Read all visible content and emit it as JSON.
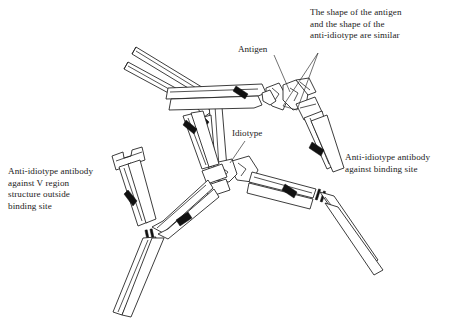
{
  "figure": {
    "type": "line-diagram",
    "background_color": "#ffffff",
    "ink_color": "#1a1a1a"
  },
  "captions": {
    "top_right": "The shape of the antigen\nand the shape of the\nanti-idiotype are similar",
    "left": "Anti-idiotype antibody\nagainst V region\nstructure outside\nbinding site",
    "right": "Anti-idiotype antibody\nagainst binding site"
  },
  "labels": {
    "antigen": "Antigen",
    "idiotype": "Idiotype"
  },
  "structures": {
    "antibodies": [
      {
        "name": "central-idiotype-antibody",
        "role": "idiotype bearing antibody",
        "hinge_bars": 2
      },
      {
        "name": "anti-idiotype-against-binding-site",
        "role": "anti-idiotype antibody binding the idiotype binding site",
        "hinge_bars": 2
      },
      {
        "name": "anti-idiotype-against-v-region",
        "role": "anti-idiotype antibody against V region structure outside binding site",
        "hinge_bars": 2
      }
    ],
    "antigen_shape": "notched-wedge",
    "idiotype_shape": "notched-wedge"
  }
}
